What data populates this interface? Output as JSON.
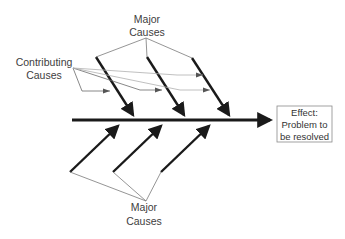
{
  "diagram": {
    "type": "fishbone",
    "labels": {
      "major_causes_top": [
        "Major",
        "Causes"
      ],
      "contributing_causes": [
        "Contributing",
        "Causes"
      ],
      "major_causes_bottom": [
        "Major",
        "Causes"
      ],
      "effect": [
        "Effect:",
        "Problem to",
        "be resolved"
      ]
    },
    "colors": {
      "bone": "#1a1a1a",
      "leader": "#7a7a7a",
      "text": "#404040",
      "box_border": "#8a8a8a"
    }
  }
}
